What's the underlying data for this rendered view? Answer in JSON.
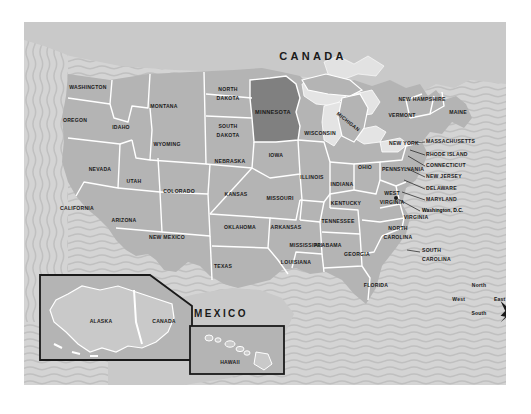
{
  "map": {
    "title_canada": "CANADA",
    "title_mexico": "MEXICO",
    "highlighted_state": "MINNESOTA",
    "colors": {
      "ocean": "#d2d2d2",
      "land": "#b4b4b4",
      "land_foreign": "#c9c9c9",
      "highlight": "#808080",
      "border": "#ffffff",
      "text": "#1a1a1a",
      "inset_frame": "#1a1a1a",
      "page_background": "#ffffff"
    }
  },
  "states": [
    {
      "name": "WASHINGTON",
      "x": 64,
      "y": 66,
      "size": "s5"
    },
    {
      "name": "OREGON",
      "x": 51,
      "y": 99,
      "size": "s5"
    },
    {
      "name": "IDAHO",
      "x": 97,
      "y": 106,
      "size": "s5"
    },
    {
      "name": "MONTANA",
      "x": 140,
      "y": 85,
      "size": "s5"
    },
    {
      "name": "WYOMING",
      "x": 143,
      "y": 123,
      "size": "s5"
    },
    {
      "name": "NEVADA",
      "x": 76,
      "y": 148,
      "size": "s5"
    },
    {
      "name": "UTAH",
      "x": 110,
      "y": 160,
      "size": "s5"
    },
    {
      "name": "CALIFORNIA",
      "x": 53,
      "y": 187,
      "size": "s5"
    },
    {
      "name": "ARIZONA",
      "x": 100,
      "y": 199,
      "size": "s5"
    },
    {
      "name": "COLORADO",
      "x": 155,
      "y": 170,
      "size": "s5"
    },
    {
      "name": "NEW MEXICO",
      "x": 143,
      "y": 216,
      "size": "s5"
    },
    {
      "name": "NORTH",
      "x": 204,
      "y": 68,
      "size": "s5"
    },
    {
      "name": "DAKOTA",
      "x": 204,
      "y": 76,
      "size": "s5"
    },
    {
      "name": "SOUTH",
      "x": 204,
      "y": 105,
      "size": "s5"
    },
    {
      "name": "DAKOTA",
      "x": 204,
      "y": 113,
      "size": "s5"
    },
    {
      "name": "NEBRASKA",
      "x": 206,
      "y": 140,
      "size": "s5"
    },
    {
      "name": "KANSAS",
      "x": 212,
      "y": 173,
      "size": "s5"
    },
    {
      "name": "OKLAHOMA",
      "x": 216,
      "y": 206,
      "size": "s5"
    },
    {
      "name": "TEXAS",
      "x": 199,
      "y": 245,
      "size": "s5"
    },
    {
      "name": "MINNESOTA",
      "x": 249,
      "y": 91,
      "size": "s55"
    },
    {
      "name": "IOWA",
      "x": 252,
      "y": 134,
      "size": "s5"
    },
    {
      "name": "MISSOURI",
      "x": 256,
      "y": 177,
      "size": "s5"
    },
    {
      "name": "ARKANSAS",
      "x": 260,
      "y": 206,
      "size": "s5"
    },
    {
      "name": "LOUISIANA",
      "x": 268,
      "y": 239,
      "size": "s5"
    },
    {
      "name": "MISSISSIPPI",
      "x": 282,
      "y": 224,
      "size": "s5"
    },
    {
      "name": "WISCONSIN",
      "x": 293,
      "y": 110,
      "size": "s5"
    },
    {
      "name": "ILLINOIS",
      "x": 288,
      "y": 154,
      "size": "s5"
    },
    {
      "name": "INDIANA",
      "x": 317,
      "y": 161,
      "size": "s5"
    },
    {
      "name": "MICHIGAN",
      "x": 323,
      "y": 100,
      "size": "s5"
    },
    {
      "name": "OHIO",
      "x": 341,
      "y": 146,
      "size": "s5"
    },
    {
      "name": "KENTUCKY",
      "x": 323,
      "y": 180,
      "size": "s5"
    },
    {
      "name": "TENNESSEE",
      "x": 318,
      "y": 198,
      "size": "s5"
    },
    {
      "name": "ALABAMA",
      "x": 306,
      "y": 222,
      "size": "s5"
    },
    {
      "name": "GEORGIA",
      "x": 333,
      "y": 231,
      "size": "s5"
    },
    {
      "name": "FLORIDA",
      "x": 350,
      "y": 263,
      "size": "s5"
    },
    {
      "name": "WEST",
      "x": 368,
      "y": 172,
      "size": "s5"
    },
    {
      "name": "VIRGINIA",
      "x": 368,
      "y": 180,
      "size": "s5"
    },
    {
      "name": "VIRGINIA",
      "x": 389,
      "y": 193,
      "size": "s5"
    },
    {
      "name": "NORTH",
      "x": 374,
      "y": 205,
      "size": "s5"
    },
    {
      "name": "CAROLINA",
      "x": 374,
      "y": 213,
      "size": "s5"
    },
    {
      "name": "NEW YORK",
      "x": 379,
      "y": 121,
      "size": "s5"
    },
    {
      "name": "PENNSYLVANIA",
      "x": 379,
      "y": 146,
      "size": "s5"
    },
    {
      "name": "VERMONT",
      "x": 378,
      "y": 93,
      "size": "s5"
    },
    {
      "name": "NEW HAMPSHIRE",
      "x": 394,
      "y": 78,
      "size": "s5"
    },
    {
      "name": "MAINE",
      "x": 433,
      "y": 90,
      "size": "s5"
    }
  ],
  "callouts": [
    {
      "label": "MASSACHUSETTS",
      "x": 404,
      "y": 120,
      "line": "M 390 121 L 401 120"
    },
    {
      "label": "RHODE ISLAND",
      "x": 404,
      "y": 133,
      "line": "M 386 127 L 401 133"
    },
    {
      "label": "CONNECTICUT",
      "x": 404,
      "y": 144,
      "line": "M 384 133 L 401 144"
    },
    {
      "label": "NEW JERSEY",
      "x": 404,
      "y": 155,
      "line": "M 382 145 L 401 155"
    },
    {
      "label": "DELAWARE",
      "x": 404,
      "y": 167,
      "line": "M 380 158 L 401 167"
    },
    {
      "label": "MARYLAND",
      "x": 404,
      "y": 178,
      "line": "M 378 170 L 401 178"
    },
    {
      "label": "SOUTH",
      "x": 406,
      "y": 230,
      "line": "M 382 227 L 397 229"
    },
    {
      "label": "CAROLINA",
      "x": 406,
      "y": 238,
      "line": ""
    }
  ],
  "dc": {
    "label": "Washington, D.C.",
    "x": 405,
    "y": 190,
    "marker_x": 372,
    "marker_y": 176,
    "line": "M 374 177 L 396 189"
  },
  "insets": [
    {
      "name": "alaska-inset",
      "labels": [
        "ALASKA",
        "CANADA"
      ]
    },
    {
      "name": "hawaii-inset",
      "labels": [
        "HAWAII"
      ]
    }
  ],
  "compass": {
    "north": "North",
    "south": "South",
    "east": "East",
    "west": "West",
    "cx": 455,
    "cy": 277
  }
}
